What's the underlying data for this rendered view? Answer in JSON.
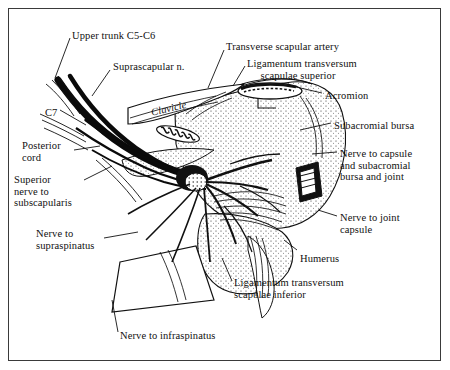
{
  "figure": {
    "domain": "anatomical-illustration",
    "background_color": "#ffffff",
    "ink_color": "#101010",
    "frame_color": "#3a3a3a"
  },
  "labels": [
    {
      "id": "upper-trunk",
      "text": "Upper trunk C5-C6",
      "x": 72,
      "y": 30,
      "align": "left"
    },
    {
      "id": "suprascapular-n",
      "text": "Suprascapular n.",
      "x": 113,
      "y": 61,
      "align": "left"
    },
    {
      "id": "transverse-artery",
      "text": "Transverse scapular artery",
      "x": 226,
      "y": 41,
      "align": "left"
    },
    {
      "id": "lig-trans-sup",
      "text": "Ligamentum transversum\n     scapulae superior",
      "x": 247,
      "y": 58,
      "align": "left"
    },
    {
      "id": "acromion",
      "text": "Acromion",
      "x": 325,
      "y": 90,
      "align": "left"
    },
    {
      "id": "subacromial-bursa",
      "text": "Subacromial bursa",
      "x": 334,
      "y": 120,
      "align": "left"
    },
    {
      "id": "nerve-capsule-bursa",
      "text": "Nerve to capsule\nand subacromial\nbursa and joint",
      "x": 340,
      "y": 148,
      "align": "left"
    },
    {
      "id": "nerve-joint-capsule",
      "text": "Nerve to joint\ncapsule",
      "x": 340,
      "y": 212,
      "align": "left"
    },
    {
      "id": "humerus",
      "text": "Humerus",
      "x": 300,
      "y": 253,
      "align": "left"
    },
    {
      "id": "clavicle",
      "text": "Clavicle",
      "x": 150,
      "y": 107,
      "align": "left",
      "rotate": -13,
      "italic": true
    },
    {
      "id": "c7",
      "text": "C7",
      "x": 45,
      "y": 107,
      "align": "left"
    },
    {
      "id": "posterior-cord",
      "text": "Posterior\ncord",
      "x": 22,
      "y": 140,
      "align": "left"
    },
    {
      "id": "superior-nerve-subscap",
      "text": "Superior\nnerve to\nsubscapularis",
      "x": 14,
      "y": 174,
      "align": "left"
    },
    {
      "id": "nerve-supraspinatus",
      "text": "Nerve to\nsupraspinatus",
      "x": 36,
      "y": 228,
      "align": "left"
    },
    {
      "id": "lig-trans-inf",
      "text": "Ligamentum transversum\nscapulae inferior",
      "x": 234,
      "y": 277,
      "align": "left"
    },
    {
      "id": "nerve-infraspinatus",
      "text": "Nerve to infraspinatus",
      "x": 120,
      "y": 330,
      "align": "left"
    }
  ],
  "leader_lines": [
    {
      "id": "leader-upper-trunk",
      "points": "70,38 55,78"
    },
    {
      "id": "leader-suprascapular",
      "points": "110,70 92,96"
    },
    {
      "id": "leader-transverse-artery",
      "points": "224,50 208,88"
    },
    {
      "id": "leader-lig-sup",
      "points": "245,66 233,86"
    },
    {
      "id": "leader-acromion",
      "points": "322,93 292,86"
    },
    {
      "id": "leader-bursa",
      "points": "331,123 300,130"
    },
    {
      "id": "leader-nerve-capsule",
      "points": "337,152 312,154"
    },
    {
      "id": "leader-nerve-joint",
      "points": "337,216 318,210"
    },
    {
      "id": "leader-humerus",
      "points": "297,250 284,240"
    },
    {
      "id": "leader-c7",
      "points": "60,110 86,125"
    },
    {
      "id": "leader-post-cord",
      "points": "74,150 100,146"
    },
    {
      "id": "leader-sup-subscap",
      "points": "84,180 112,166"
    },
    {
      "id": "leader-supraspinatus",
      "points": "104,238 138,232"
    },
    {
      "id": "leader-lig-inf",
      "points": "232,281 222,258"
    },
    {
      "id": "leader-infraspinatus",
      "points": "118,332 112,300"
    }
  ]
}
